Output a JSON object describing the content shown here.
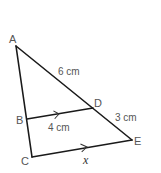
{
  "diagram": {
    "type": "similar-triangles",
    "points": {
      "A": {
        "label": "A",
        "x": 16,
        "y": 46
      },
      "B": {
        "label": "B",
        "x": 27,
        "y": 119
      },
      "C": {
        "label": "C",
        "x": 32,
        "y": 157
      },
      "D": {
        "label": "D",
        "x": 93,
        "y": 108
      },
      "E": {
        "label": "E",
        "x": 132,
        "y": 140
      }
    },
    "measurements": {
      "AD": "6 cm",
      "DE": "3 cm",
      "BD": "4 cm",
      "CE": "x"
    },
    "parallel_marks": [
      "BD",
      "CE"
    ]
  }
}
